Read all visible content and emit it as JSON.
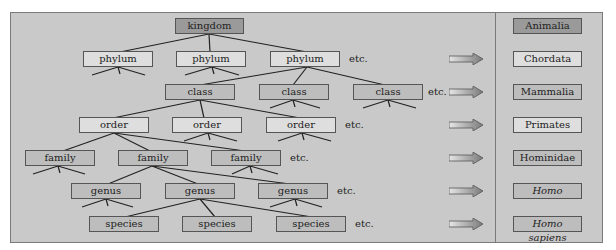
{
  "hierarchy": {
    "kingdom": "kingdom",
    "phylum": [
      "phylum",
      "phylum",
      "phylum"
    ],
    "class": [
      "class",
      "class",
      "class"
    ],
    "order": [
      "order",
      "order",
      "order"
    ],
    "family": [
      "family",
      "family",
      "family"
    ],
    "genus": [
      "genus",
      "genus",
      "genus"
    ],
    "species": [
      "species",
      "species",
      "species"
    ],
    "etc_label": "etc."
  },
  "example": {
    "kingdom": "Animalia",
    "phylum": "Chordata",
    "class": "Mammalia",
    "order": "Primates",
    "family": "Hominidae",
    "genus": "Homo",
    "species": "Homo sapiens"
  },
  "colors": {
    "panel": "#c9c9c9",
    "dark_box": "#9a9a9a",
    "mid_box": "#bdbdbd",
    "light_box": "#dedede"
  }
}
